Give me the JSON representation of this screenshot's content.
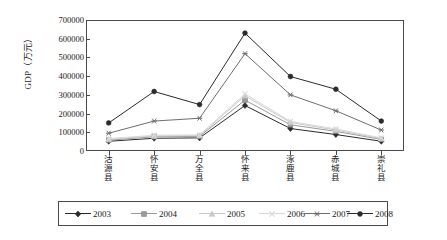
{
  "chart_data": {
    "type": "line",
    "title": "",
    "xlabel": "",
    "ylabel": "GDP（万元）",
    "ylim": [
      0,
      700000
    ],
    "ytick_labels": [
      "700000",
      "600000",
      "500000",
      "400000",
      "300000",
      "200000",
      "100000",
      "0"
    ],
    "ytick_values": [
      700000,
      600000,
      500000,
      400000,
      300000,
      200000,
      100000,
      0
    ],
    "grid": false,
    "legend_position": "bottom",
    "categories": [
      "沽源县",
      "怀安县",
      "万全县",
      "怀来县",
      "涿鹿县",
      "赤城县",
      "崇礼县"
    ],
    "series": [
      {
        "name": "2003",
        "marker": "diamond",
        "color": "#2b2b2b",
        "values": [
          52000,
          68000,
          70000,
          243000,
          120000,
          88000,
          52000
        ]
      },
      {
        "name": "2004",
        "marker": "square",
        "color": "#9a9a9a",
        "values": [
          58000,
          76000,
          78000,
          272000,
          140000,
          105000,
          62000
        ]
      },
      {
        "name": "2005",
        "marker": "triangle",
        "color": "#c8c8c8",
        "values": [
          62000,
          80000,
          82000,
          295000,
          152000,
          112000,
          66000
        ]
      },
      {
        "name": "2006",
        "marker": "cross",
        "color": "#d8d8d8",
        "values": [
          66000,
          84000,
          86000,
          305000,
          158000,
          118000,
          70000
        ]
      },
      {
        "name": "2007",
        "marker": "asterisk",
        "color": "#6e6e6e",
        "values": [
          95000,
          160000,
          175000,
          520000,
          300000,
          215000,
          112000
        ]
      },
      {
        "name": "2008",
        "marker": "circle",
        "color": "#2b2b2b",
        "values": [
          150000,
          318000,
          248000,
          630000,
          398000,
          330000,
          160000
        ]
      }
    ]
  },
  "legend": {
    "items": [
      {
        "label": "2003"
      },
      {
        "label": "2004"
      },
      {
        "label": "2005"
      },
      {
        "label": "2006"
      },
      {
        "label": "2007"
      },
      {
        "label": "2008"
      }
    ]
  }
}
